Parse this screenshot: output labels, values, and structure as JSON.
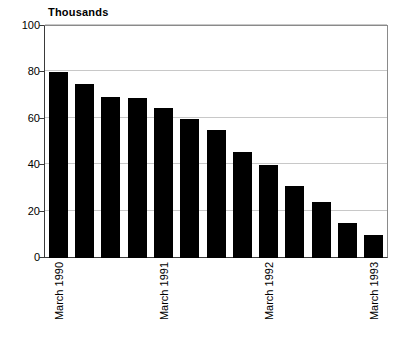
{
  "chart_data": {
    "type": "bar",
    "title": "Thousands",
    "subtitle": "",
    "xlabel": "",
    "ylabel": "Thousands",
    "ylim": [
      0,
      100
    ],
    "ytick_values": [
      0,
      20,
      40,
      60,
      80,
      100
    ],
    "ytick_labels": [
      "0",
      "20",
      "40",
      "60",
      "80",
      "100"
    ],
    "grid": true,
    "legend": false,
    "legend_position": "none",
    "bar_color": "#000000",
    "categories": [
      "March 1990",
      "",
      "",
      "",
      "March 1991",
      "",
      "",
      "",
      "March 1992",
      "",
      "",
      "",
      "March 1993"
    ],
    "values": [
      80,
      75,
      69.5,
      69,
      64.5,
      60,
      55,
      45.5,
      40,
      31,
      24,
      15,
      10
    ],
    "x_axis_tick_labels": [
      {
        "index": 0,
        "label": "March 1990"
      },
      {
        "index": 4,
        "label": "March 1991"
      },
      {
        "index": 8,
        "label": "March 1992"
      },
      {
        "index": 12,
        "label": "March 1993"
      }
    ]
  },
  "colors": {
    "bar": "#000000",
    "grid": "#c8c8c8",
    "axis": "#3a3a3a",
    "frame": "#8a8a8a",
    "background": "#ffffff",
    "text": "#000000"
  }
}
